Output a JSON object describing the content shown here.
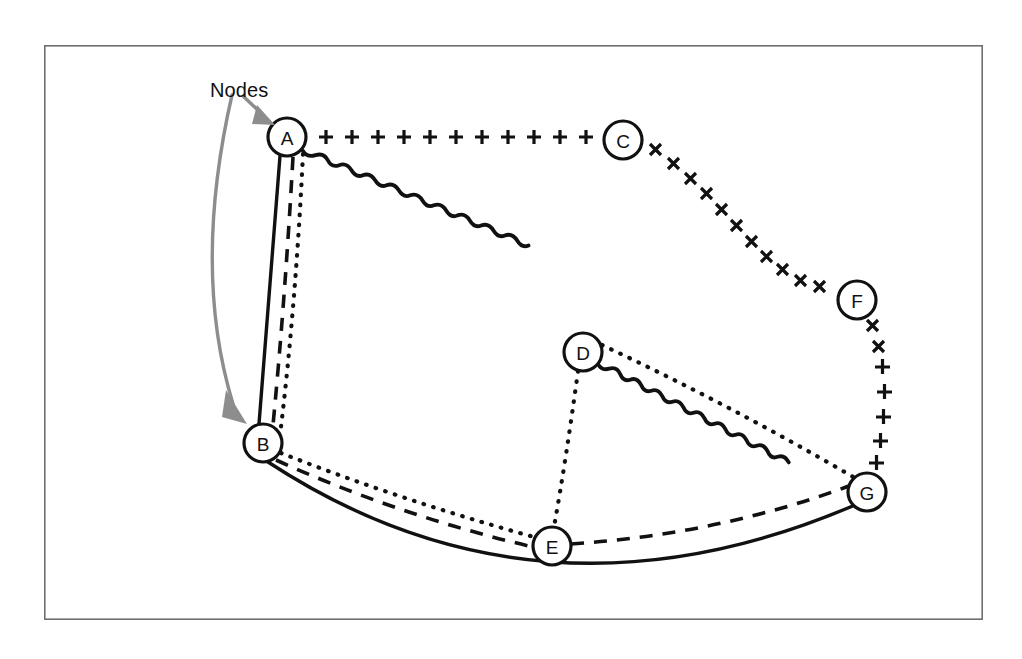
{
  "figure": {
    "kind": "network-graph-diagram",
    "background_color": "#ffffff",
    "frame": {
      "x": 44,
      "y": 45,
      "width": 939,
      "height": 575,
      "stroke_color": "#6f6f6f"
    },
    "annotation": {
      "label": "Nodes",
      "label_x": 210,
      "label_y": 79,
      "color": "#8d8d8d",
      "targets": [
        "A",
        "B"
      ]
    },
    "node_style": {
      "radius": 19,
      "fill": "#ffffff",
      "stroke_color": "#111111",
      "stroke_width": 3.2,
      "label_color": "#111111"
    },
    "nodes": [
      {
        "id": "A",
        "label": "A",
        "x": 287,
        "y": 137
      },
      {
        "id": "B",
        "label": "B",
        "x": 263,
        "y": 443
      },
      {
        "id": "C",
        "label": "C",
        "x": 623,
        "y": 140
      },
      {
        "id": "D",
        "label": "D",
        "x": 583,
        "y": 352
      },
      {
        "id": "E",
        "label": "E",
        "x": 552,
        "y": 546
      },
      {
        "id": "F",
        "label": "F",
        "x": 857,
        "y": 300
      },
      {
        "id": "G",
        "label": "G",
        "x": 867,
        "y": 492
      }
    ],
    "edges": [
      {
        "id": "A-B-solid",
        "from": "A",
        "to": "B",
        "style": "solid",
        "offset": 0
      },
      {
        "id": "A-B-dashed",
        "from": "A",
        "to": "B",
        "style": "dashed",
        "offset": 13
      },
      {
        "id": "A-B-dotted",
        "from": "A",
        "to": "B",
        "style": "dotted",
        "offset": 26
      },
      {
        "id": "A-C-plus",
        "from": "A",
        "to": "C",
        "style": "plus-marks",
        "marks": 13
      },
      {
        "id": "A-D-wavy",
        "from": "A",
        "to": "D",
        "style": "wavy"
      },
      {
        "id": "C-F-cross",
        "from": "C",
        "to": "F",
        "style": "cross-marks",
        "marks": 14
      },
      {
        "id": "F-G-plus",
        "from": "F",
        "to": "G",
        "style": "plus-marks",
        "marks": 9
      },
      {
        "id": "D-G-wavy",
        "from": "D",
        "to": "G",
        "style": "wavy"
      },
      {
        "id": "D-G-dotted",
        "from": "D",
        "to": "G",
        "style": "dotted",
        "offset": -22
      },
      {
        "id": "D-E-dotted",
        "from": "D",
        "to": "E",
        "style": "dotted"
      },
      {
        "id": "B-E-dotted",
        "from": "B",
        "to": "E",
        "style": "dotted"
      },
      {
        "id": "B-E-dashed",
        "from": "B",
        "to": "E",
        "style": "dashed"
      },
      {
        "id": "E-G-dashed",
        "from": "E",
        "to": "G",
        "style": "dashed"
      },
      {
        "id": "B-G-solid",
        "from": "B",
        "to": "G",
        "style": "solid-curve"
      }
    ],
    "legend_of_styles": [
      "solid line",
      "dashed line",
      "dotted line",
      "wavy line",
      "plus-mark line",
      "cross-mark line"
    ]
  }
}
